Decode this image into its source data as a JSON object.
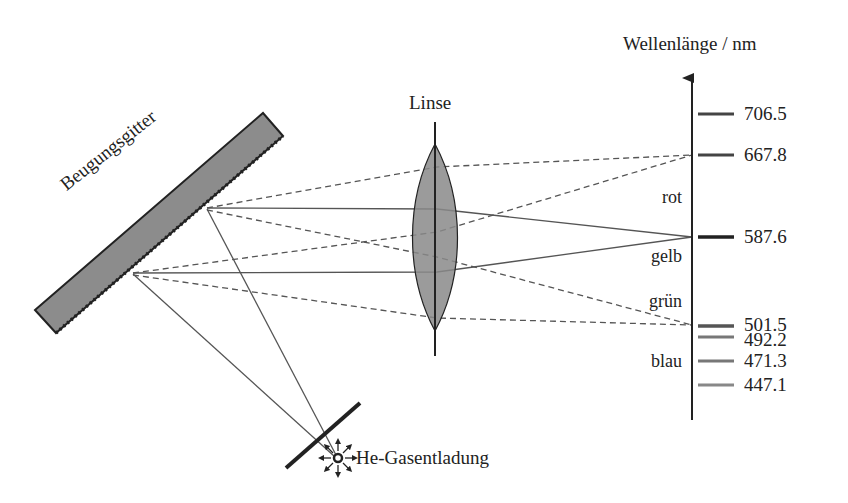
{
  "diagram": {
    "title_axis": "Wellenlänge / nm",
    "lens_label": "Linse",
    "grating_label": "Beugungsgitter",
    "source_label": "He-Gasentladung",
    "color_bands": [
      {
        "label": "rot",
        "y": 198
      },
      {
        "label": "gelb",
        "y": 257
      },
      {
        "label": "grün",
        "y": 302
      },
      {
        "label": "blau",
        "y": 362
      }
    ],
    "spectral_lines": [
      {
        "wavelength": "706.5",
        "y": 114,
        "color": "#444444",
        "thickness": 3
      },
      {
        "wavelength": "667.8",
        "y": 155,
        "color": "#444444",
        "thickness": 3
      },
      {
        "wavelength": "587.6",
        "y": 237,
        "color": "#222222",
        "thickness": 3.5
      },
      {
        "wavelength": "501.5",
        "y": 326,
        "color": "#555555",
        "thickness": 3.5
      },
      {
        "wavelength": "492.2",
        "y": 337,
        "color": "#777777",
        "thickness": 3
      },
      {
        "wavelength": "471.3",
        "y": 361,
        "color": "#777777",
        "thickness": 3
      },
      {
        "wavelength": "447.1",
        "y": 385,
        "color": "#888888",
        "thickness": 3
      }
    ],
    "colors": {
      "grating_fill": "#8c8c8c",
      "lens_fill": "#8a8a8a",
      "ray_color": "#555555",
      "line_color": "#222222"
    }
  }
}
